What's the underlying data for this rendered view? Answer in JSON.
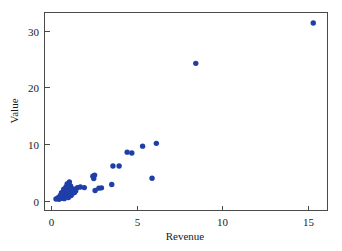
{
  "chart_data": {
    "type": "scatter",
    "title": "",
    "xlabel": "Revenue",
    "ylabel": "Value",
    "xlim": [
      -0.4,
      16.1
    ],
    "ylim": [
      -1.6,
      33.3
    ],
    "xticks": [
      0,
      5,
      10,
      15
    ],
    "xtick_labels": [
      "0",
      "5",
      "10",
      "15"
    ],
    "yticks": [
      0,
      10,
      20,
      30
    ],
    "ytick_labels": [
      "0",
      "10",
      "20",
      "30"
    ],
    "grid": false,
    "legend": null,
    "marker": {
      "shape": "circle",
      "color": "#1f3fa8",
      "size": 4.2
    },
    "series": [
      {
        "name": "observations",
        "color": "#1f3fa8",
        "points": [
          [
            0.3,
            0.35
          ],
          [
            0.42,
            0.55
          ],
          [
            0.48,
            0.3
          ],
          [
            0.55,
            0.95
          ],
          [
            0.6,
            0.45
          ],
          [
            0.62,
            1.45
          ],
          [
            0.68,
            0.7
          ],
          [
            0.72,
            1.1
          ],
          [
            0.75,
            2.05
          ],
          [
            0.78,
            0.4
          ],
          [
            0.82,
            1.75
          ],
          [
            0.85,
            1.3
          ],
          [
            0.88,
            2.45
          ],
          [
            0.9,
            0.85
          ],
          [
            0.92,
            1.6
          ],
          [
            0.95,
            3.0
          ],
          [
            0.98,
            1.15
          ],
          [
            1.0,
            2.2
          ],
          [
            1.02,
            0.6
          ],
          [
            1.05,
            1.9
          ],
          [
            1.08,
            3.35
          ],
          [
            1.1,
            1.4
          ],
          [
            1.15,
            2.65
          ],
          [
            1.18,
            0.95
          ],
          [
            1.2,
            1.7
          ],
          [
            1.25,
            1.25
          ],
          [
            1.3,
            2.1
          ],
          [
            1.38,
            1.5
          ],
          [
            1.45,
            1.8
          ],
          [
            1.55,
            2.35
          ],
          [
            1.72,
            2.45
          ],
          [
            1.95,
            2.35
          ],
          [
            2.45,
            4.35
          ],
          [
            2.5,
            3.95
          ],
          [
            2.55,
            4.55
          ],
          [
            2.58,
            1.85
          ],
          [
            2.8,
            2.25
          ],
          [
            2.95,
            2.3
          ],
          [
            3.55,
            2.9
          ],
          [
            3.62,
            6.15
          ],
          [
            3.98,
            6.15
          ],
          [
            4.45,
            8.6
          ],
          [
            4.72,
            8.45
          ],
          [
            5.35,
            9.65
          ],
          [
            5.9,
            4.0
          ],
          [
            6.15,
            10.15
          ],
          [
            8.45,
            24.25
          ],
          [
            15.3,
            31.35
          ]
        ]
      }
    ]
  },
  "axes_geometry": {
    "plot_left": 44,
    "plot_right": 327,
    "plot_top": 12,
    "plot_bottom": 210
  }
}
